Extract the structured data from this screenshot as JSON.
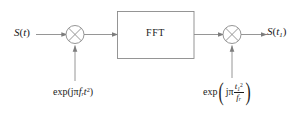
{
  "diagram": {
    "line_color": "#8a8a8a",
    "text_color": "#1a1a1a",
    "background": "#ffffff"
  },
  "input": {
    "symbol": "S",
    "open": "(",
    "arg": "t",
    "close": ")"
  },
  "output": {
    "symbol": "S",
    "open": "(",
    "arg": "t",
    "arg_sub": "1",
    "close": ")"
  },
  "block": {
    "label": "FFT"
  },
  "multipliers": [
    {
      "name": "multiplier-1",
      "glyph": "x"
    },
    {
      "name": "multiplier-2",
      "glyph": "x"
    }
  ],
  "exp_left": {
    "fn": "exp",
    "open": "(",
    "j": "j",
    "pi": "π",
    "var": "f",
    "var_sub": "r",
    "t": "t",
    "t_sup": "2",
    "close": ")"
  },
  "exp_right": {
    "fn": "exp",
    "open": "(",
    "j": "j",
    "pi": "π",
    "num": "t",
    "num_sub": "1",
    "num_sup": "2",
    "den": "f",
    "den_sub": "r",
    "close": ")"
  }
}
